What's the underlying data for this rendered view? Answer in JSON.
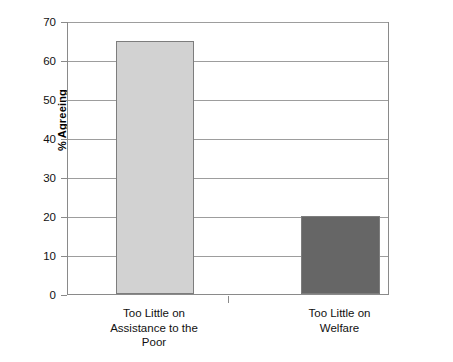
{
  "chart_data": {
    "type": "bar",
    "title": "",
    "subtitle": "",
    "xlabel": "",
    "ylabel": "% Agreeing",
    "categories": [
      "Too Little on Assistance to the Poor",
      "Too Little on Welfare"
    ],
    "category_lines": [
      [
        "Too Little on",
        "Assistance to the",
        "Poor"
      ],
      [
        "Too Little on",
        "Welfare"
      ]
    ],
    "values": [
      65,
      20
    ],
    "ylim": [
      0,
      70
    ],
    "ytick_values": [
      0,
      10,
      20,
      30,
      40,
      50,
      60,
      70
    ],
    "ytick_labels": [
      "0",
      "10",
      "20",
      "30",
      "40",
      "50",
      "60",
      "70"
    ],
    "grid": "horizontal",
    "legend": "none",
    "bar_colors": [
      "#d2d2d2",
      "#666666"
    ],
    "bar_edge_color": "#7d7d7d",
    "gridline_color": "#9d9d9d",
    "axis_color": "#8a8a8a",
    "background_color": "#ffffff",
    "text_color": "#111111"
  }
}
